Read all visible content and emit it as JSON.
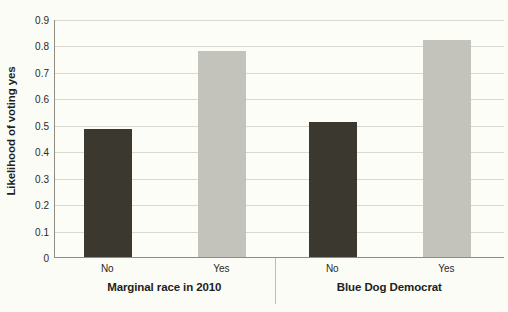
{
  "chart_data": {
    "type": "bar",
    "title": "",
    "xlabel": "",
    "ylabel": "Likelihood of voting yes",
    "ylim": [
      0,
      0.9
    ],
    "ytick_labels": [
      "0",
      "0.1",
      "0.2",
      "0.3",
      "0.4",
      "0.5",
      "0.6",
      "0.7",
      "0.8",
      "0.9"
    ],
    "ytick_values": [
      0,
      0.1,
      0.2,
      0.3,
      0.4,
      0.5,
      0.6,
      0.7,
      0.8,
      0.9
    ],
    "grid": true,
    "legend": "none",
    "groups": [
      {
        "label": "Marginal race in 2010",
        "categories": [
          "No",
          "Yes"
        ],
        "values": [
          0.485,
          0.78
        ],
        "colors": [
          "#3a382f",
          "#c3c3bb"
        ]
      },
      {
        "label": "Blue Dog Democrat",
        "categories": [
          "No",
          "Yes"
        ],
        "values": [
          0.51,
          0.82
        ],
        "colors": [
          "#3a382f",
          "#c3c3bb"
        ]
      }
    ],
    "categories": [
      "No",
      "Yes",
      "No",
      "Yes"
    ],
    "values": [
      0.485,
      0.78,
      0.51,
      0.82
    ],
    "colors": {
      "bar_dark": "#3a382f",
      "bar_light": "#c3c3bb",
      "background": "#fdfdf8",
      "gridline": "#d9d9d2",
      "axis": "#8d8d85",
      "text": "#221f1c"
    }
  }
}
